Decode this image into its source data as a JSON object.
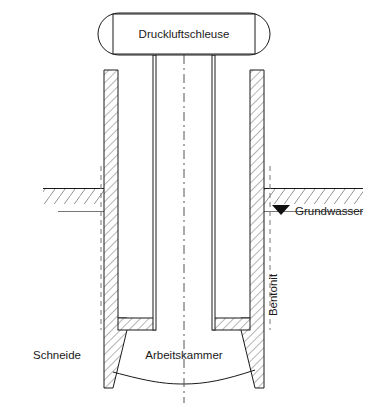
{
  "figure": {
    "title_visible": false,
    "background_color": "#ffffff",
    "line_color": "#1a1a1a",
    "hatch_color": "#555555",
    "text_color": "#1a1a1a",
    "type": "engineering-cross-section",
    "width": 371,
    "height": 413
  },
  "labels": {
    "airlock": "Druckluftschleuse",
    "groundwater": "Grundwasser",
    "bentonite": "Bentonit",
    "cutting_edge": "Schneide",
    "working_chamber": "Arbeitskammer"
  },
  "icons": {
    "groundwater_marker": "filled-down-triangle",
    "centerline": "dash-dot-vertical",
    "hatching": "diagonal-45-lines"
  },
  "geometry": {
    "airlock": {
      "x": 98,
      "y": 13,
      "width": 172,
      "height": 42,
      "rx": 21
    },
    "airlock_inner": {
      "x": 113,
      "y": 14,
      "width": 142,
      "height": 40
    },
    "shaft": {
      "left_wall_x": 155,
      "right_wall_x": 213,
      "top_y": 55,
      "bottom_y": 318
    },
    "caisson_wall_left": {
      "x": 104,
      "y": 70,
      "width": 14
    },
    "caisson_wall_right": {
      "x": 250,
      "y": 70,
      "width": 14
    },
    "ground_surface_y": 188,
    "groundwater_level_y": 212,
    "chamber_roof_y": 318,
    "cutting_edge_bottom_y": 388
  }
}
